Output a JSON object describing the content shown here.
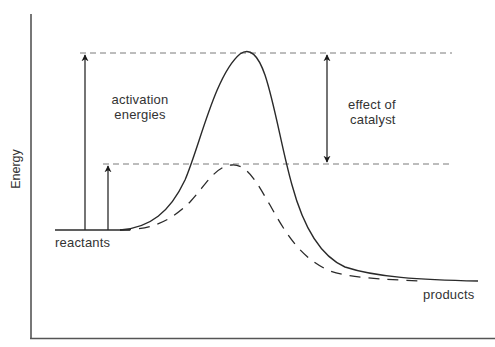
{
  "diagram": {
    "type": "reaction energy profile",
    "axis": {
      "y_label": "Energy",
      "x_label": ""
    },
    "labels": {
      "activation_line1": "activation",
      "activation_line2": "energies",
      "catalyst_line1": "effect of",
      "catalyst_line2": "catalyst",
      "reactants": "reactants",
      "products": "products"
    },
    "curves": [
      {
        "name": "uncatalyzed",
        "style": "solid",
        "peak_energy": "high"
      },
      {
        "name": "catalyzed",
        "style": "dashed",
        "peak_energy": "lower"
      }
    ],
    "arrows": [
      {
        "name": "uncatalyzed activation energy",
        "direction": "up"
      },
      {
        "name": "catalyzed activation energy",
        "direction": "up"
      },
      {
        "name": "effect of catalyst",
        "direction": "both"
      }
    ],
    "colors": {
      "line": "#2a2a2a",
      "guide": "#777777",
      "text": "#333333"
    }
  }
}
